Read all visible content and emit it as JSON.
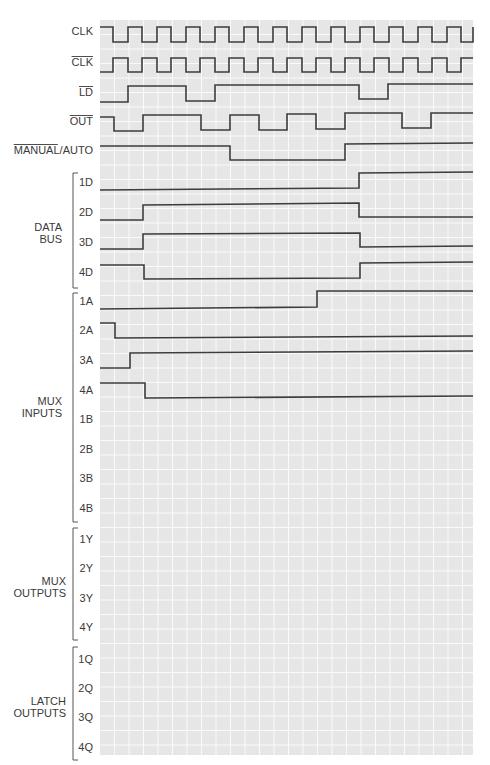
{
  "header": {
    "text": "Problems",
    "page": ""
  },
  "grid": {
    "x0": 100,
    "x1": 473,
    "y0": 20,
    "y1": 755,
    "cell": 14.5,
    "background": "#e6e6e6",
    "line_color": "#fafafa"
  },
  "signals": [
    {
      "name": "CLK",
      "label": "CLK",
      "overline": "",
      "label_y": 35,
      "label_x": 93,
      "points": [
        [
          100,
          27
        ],
        [
          113,
          27
        ],
        [
          113,
          42
        ],
        [
          128,
          42
        ],
        [
          128,
          27
        ],
        [
          142,
          27
        ],
        [
          142,
          42
        ],
        [
          157,
          42
        ],
        [
          157,
          27
        ],
        [
          171,
          27
        ],
        [
          171,
          42
        ],
        [
          186,
          42
        ],
        [
          186,
          27
        ],
        [
          200,
          27
        ],
        [
          200,
          42
        ],
        [
          215,
          42
        ],
        [
          215,
          27
        ],
        [
          229,
          27
        ],
        [
          229,
          42
        ],
        [
          244,
          42
        ],
        [
          244,
          27
        ],
        [
          258,
          27
        ],
        [
          258,
          42
        ],
        [
          273,
          42
        ],
        [
          273,
          27
        ],
        [
          287,
          27
        ],
        [
          287,
          42
        ],
        [
          302,
          42
        ],
        [
          302,
          27
        ],
        [
          316,
          27
        ],
        [
          316,
          42
        ],
        [
          331,
          42
        ],
        [
          331,
          27
        ],
        [
          345,
          27
        ],
        [
          345,
          42
        ],
        [
          360,
          42
        ],
        [
          360,
          27
        ],
        [
          374,
          27
        ],
        [
          374,
          42
        ],
        [
          389,
          42
        ],
        [
          389,
          27
        ],
        [
          403,
          27
        ],
        [
          403,
          42
        ],
        [
          418,
          42
        ],
        [
          418,
          27
        ],
        [
          432,
          27
        ],
        [
          432,
          42
        ],
        [
          447,
          42
        ],
        [
          447,
          27
        ],
        [
          461,
          27
        ],
        [
          461,
          42
        ],
        [
          473,
          42
        ],
        [
          473,
          27
        ]
      ]
    },
    {
      "name": "CLK-bar",
      "label": "CLK",
      "overline": "CLK",
      "label_y": 66,
      "label_x": 93,
      "points": [
        [
          100,
          72
        ],
        [
          113,
          72
        ],
        [
          113,
          58
        ],
        [
          128,
          58
        ],
        [
          128,
          72
        ],
        [
          142,
          72
        ],
        [
          142,
          58
        ],
        [
          157,
          58
        ],
        [
          157,
          72
        ],
        [
          171,
          72
        ],
        [
          171,
          58
        ],
        [
          186,
          58
        ],
        [
          186,
          72
        ],
        [
          200,
          72
        ],
        [
          200,
          58
        ],
        [
          215,
          58
        ],
        [
          215,
          72
        ],
        [
          229,
          72
        ],
        [
          229,
          58
        ],
        [
          244,
          58
        ],
        [
          244,
          72
        ],
        [
          258,
          72
        ],
        [
          258,
          58
        ],
        [
          273,
          58
        ],
        [
          273,
          72
        ],
        [
          287,
          72
        ],
        [
          287,
          58
        ],
        [
          302,
          58
        ],
        [
          302,
          72
        ],
        [
          316,
          72
        ],
        [
          316,
          58
        ],
        [
          331,
          58
        ],
        [
          331,
          72
        ],
        [
          345,
          72
        ],
        [
          345,
          58
        ],
        [
          360,
          58
        ],
        [
          360,
          72
        ],
        [
          374,
          72
        ],
        [
          374,
          58
        ],
        [
          389,
          58
        ],
        [
          389,
          72
        ],
        [
          403,
          72
        ],
        [
          403,
          58
        ],
        [
          418,
          58
        ],
        [
          418,
          72
        ],
        [
          432,
          72
        ],
        [
          432,
          58
        ],
        [
          447,
          58
        ],
        [
          447,
          72
        ],
        [
          461,
          72
        ],
        [
          461,
          58
        ],
        [
          473,
          58
        ]
      ]
    },
    {
      "name": "LD-bar",
      "label": "LD",
      "overline": "LD",
      "label_y": 96,
      "label_x": 93,
      "points": [
        [
          100,
          102
        ],
        [
          128,
          102
        ],
        [
          128,
          86
        ],
        [
          186,
          86
        ],
        [
          186,
          101
        ],
        [
          215,
          101
        ],
        [
          215,
          85
        ],
        [
          359,
          85
        ],
        [
          359,
          99
        ],
        [
          388,
          99
        ],
        [
          388,
          84
        ],
        [
          473,
          84
        ]
      ]
    },
    {
      "name": "OUT-bar",
      "label": "OUT",
      "overline": "OUT",
      "label_y": 125,
      "label_x": 93,
      "points": [
        [
          100,
          117
        ],
        [
          114,
          117
        ],
        [
          114,
          131
        ],
        [
          143,
          131
        ],
        [
          143,
          115
        ],
        [
          201,
          115
        ],
        [
          201,
          130
        ],
        [
          230,
          130
        ],
        [
          230,
          115
        ],
        [
          259,
          115
        ],
        [
          259,
          130
        ],
        [
          287,
          130
        ],
        [
          287,
          114
        ],
        [
          316,
          114
        ],
        [
          316,
          129
        ],
        [
          345,
          129
        ],
        [
          345,
          113
        ],
        [
          402,
          113
        ],
        [
          402,
          128
        ],
        [
          431,
          128
        ],
        [
          431,
          113
        ],
        [
          473,
          113
        ]
      ]
    },
    {
      "name": "MANUAL-bar-AUTO",
      "label": "MANUAL/AUTO",
      "overline": "MANUAL",
      "label_y": 154,
      "label_x": 93,
      "points": [
        [
          100,
          146
        ],
        [
          230,
          146
        ],
        [
          230,
          160
        ],
        [
          345,
          160
        ],
        [
          345,
          144
        ],
        [
          473,
          143
        ]
      ]
    },
    {
      "name": "1D",
      "label": "1D",
      "overline": "",
      "label_y": 186,
      "label_x": 93,
      "points": [
        [
          100,
          190
        ],
        [
          359,
          188
        ],
        [
          359,
          173
        ],
        [
          473,
          172
        ]
      ]
    },
    {
      "name": "2D",
      "label": "2D",
      "overline": "",
      "label_y": 216,
      "label_x": 93,
      "points": [
        [
          100,
          220
        ],
        [
          143,
          220
        ],
        [
          143,
          205
        ],
        [
          359,
          203
        ],
        [
          359,
          217
        ],
        [
          473,
          217
        ]
      ]
    },
    {
      "name": "3D",
      "label": "3D",
      "overline": "",
      "label_y": 246,
      "label_x": 93,
      "points": [
        [
          100,
          249
        ],
        [
          143,
          249
        ],
        [
          143,
          234
        ],
        [
          360,
          233
        ],
        [
          360,
          247
        ],
        [
          473,
          246
        ]
      ]
    },
    {
      "name": "4D",
      "label": "4D",
      "overline": "",
      "label_y": 276,
      "label_x": 93,
      "points": [
        [
          100,
          265
        ],
        [
          144,
          265
        ],
        [
          144,
          279
        ],
        [
          360,
          278
        ],
        [
          360,
          263
        ],
        [
          473,
          262
        ]
      ]
    },
    {
      "name": "1A",
      "label": "1A",
      "overline": "",
      "label_y": 305,
      "label_x": 93,
      "points": [
        [
          100,
          309
        ],
        [
          317,
          307
        ],
        [
          317,
          291
        ],
        [
          473,
          291
        ]
      ]
    },
    {
      "name": "2A",
      "label": "2A",
      "overline": "",
      "label_y": 334,
      "label_x": 93,
      "points": [
        [
          100,
          323
        ],
        [
          115,
          323
        ],
        [
          115,
          338
        ],
        [
          473,
          336
        ]
      ]
    },
    {
      "name": "3A",
      "label": "3A",
      "overline": "",
      "label_y": 364,
      "label_x": 93,
      "points": [
        [
          100,
          368
        ],
        [
          130,
          368
        ],
        [
          130,
          353
        ],
        [
          473,
          351
        ]
      ]
    },
    {
      "name": "4A",
      "label": "4A",
      "overline": "",
      "label_y": 394,
      "label_x": 93,
      "points": [
        [
          100,
          383
        ],
        [
          145,
          383
        ],
        [
          145,
          398
        ],
        [
          473,
          396
        ]
      ]
    },
    {
      "name": "1B",
      "label": "1B",
      "overline": "",
      "label_y": 423,
      "label_x": 93,
      "points": []
    },
    {
      "name": "2B",
      "label": "2B",
      "overline": "",
      "label_y": 453,
      "label_x": 93,
      "points": []
    },
    {
      "name": "3B",
      "label": "3B",
      "overline": "",
      "label_y": 482,
      "label_x": 93,
      "points": []
    },
    {
      "name": "4B",
      "label": "4B",
      "overline": "",
      "label_y": 512,
      "label_x": 93,
      "points": []
    },
    {
      "name": "1Y",
      "label": "1Y",
      "overline": "",
      "label_y": 543,
      "label_x": 93,
      "points": []
    },
    {
      "name": "2Y",
      "label": "2Y",
      "overline": "",
      "label_y": 572,
      "label_x": 93,
      "points": []
    },
    {
      "name": "3Y",
      "label": "3Y",
      "overline": "",
      "label_y": 602,
      "label_x": 93,
      "points": []
    },
    {
      "name": "4Y",
      "label": "4Y",
      "overline": "",
      "label_y": 631,
      "label_x": 93,
      "points": []
    },
    {
      "name": "1Q",
      "label": "1Q",
      "overline": "",
      "label_y": 663,
      "label_x": 93,
      "points": []
    },
    {
      "name": "2Q",
      "label": "2Q",
      "overline": "",
      "label_y": 692,
      "label_x": 93,
      "points": []
    },
    {
      "name": "3Q",
      "label": "3Q",
      "overline": "",
      "label_y": 721,
      "label_x": 93,
      "points": []
    },
    {
      "name": "4Q",
      "label": "4Q",
      "overline": "",
      "label_y": 751,
      "label_x": 93,
      "points": []
    }
  ],
  "groups": [
    {
      "name": "data-bus",
      "lines": [
        "DATA",
        "BUS"
      ],
      "label_x": 62,
      "label_y": 231,
      "bracket": [
        173,
        288
      ]
    },
    {
      "name": "mux-inputs",
      "lines": [
        "MUX",
        "INPUTS"
      ],
      "label_x": 62,
      "label_y": 405,
      "bracket": [
        293,
        522
      ]
    },
    {
      "name": "mux-outputs",
      "lines": [
        "MUX",
        "OUTPUTS"
      ],
      "label_x": 66,
      "label_y": 585,
      "bracket": [
        528,
        640
      ]
    },
    {
      "name": "latch-outputs",
      "lines": [
        "LATCH",
        "OUTPUTS"
      ],
      "label_x": 66,
      "label_y": 705,
      "bracket": [
        647,
        760
      ]
    }
  ]
}
